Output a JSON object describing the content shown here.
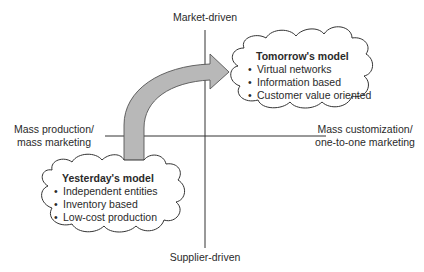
{
  "axes": {
    "top": "Market-driven",
    "bottom": "Supplier-driven",
    "left": [
      "Mass production/",
      "mass marketing"
    ],
    "right": [
      "Mass customization/",
      "one-to-one marketing"
    ]
  },
  "tomorrow": {
    "title": "Tomorrow's model",
    "items": [
      "Virtual networks",
      "Information based",
      "Customer value oriented"
    ]
  },
  "yesterday": {
    "title": "Yesterday's model",
    "items": [
      "Independent entities",
      "Inventory based",
      "Low-cost production"
    ]
  },
  "bullet": "•",
  "colors": {
    "arrow_fill": "#b8b8b8",
    "arrow_stroke": "#555555",
    "line": "#333333",
    "cloud_stroke": "#333333"
  }
}
